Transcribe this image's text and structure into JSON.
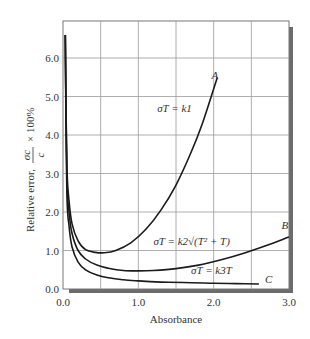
{
  "chart_data": {
    "type": "line",
    "title": "",
    "xlabel": "Absorbance",
    "ylabel": "Relative error, σc/c × 100%",
    "ylabel_parts": {
      "prefix": "Relative error,",
      "frac_num": "σc",
      "frac_den": "c",
      "suffix": "× 100%"
    },
    "xlim": [
      0.0,
      3.0
    ],
    "ylim": [
      0.0,
      6.0
    ],
    "x_ticks": [
      "0.0",
      "1.0",
      "2.0",
      "3.0"
    ],
    "y_ticks": [
      "0.0",
      "1.0",
      "2.0",
      "3.0",
      "4.0",
      "5.0",
      "6.0"
    ],
    "grid": true,
    "grid_step_x": 0.5,
    "grid_step_y": 1.0,
    "series": [
      {
        "name": "A",
        "equation": "σT = k1",
        "x": [
          0.03,
          0.05,
          0.08,
          0.12,
          0.2,
          0.3,
          0.43,
          0.55,
          0.7,
          0.9,
          1.1,
          1.3,
          1.5,
          1.7,
          1.85,
          2.0,
          2.05
        ],
        "y": [
          6.6,
          3.3,
          2.3,
          1.7,
          1.25,
          1.02,
          0.95,
          0.94,
          1.0,
          1.2,
          1.55,
          2.05,
          2.7,
          3.55,
          4.3,
          5.2,
          5.5
        ]
      },
      {
        "name": "B",
        "equation": "σT = k2√(T² + T)",
        "x": [
          0.03,
          0.05,
          0.08,
          0.12,
          0.2,
          0.3,
          0.45,
          0.6,
          0.8,
          1.0,
          1.2,
          1.5,
          1.8,
          2.1,
          2.4,
          2.7,
          3.0
        ],
        "y": [
          6.6,
          3.0,
          2.0,
          1.45,
          1.0,
          0.78,
          0.62,
          0.54,
          0.48,
          0.47,
          0.48,
          0.53,
          0.62,
          0.76,
          0.93,
          1.13,
          1.35
        ]
      },
      {
        "name": "C",
        "equation": "σT = k3T",
        "x": [
          0.03,
          0.05,
          0.08,
          0.12,
          0.2,
          0.3,
          0.45,
          0.6,
          0.8,
          1.0,
          1.3,
          1.6,
          2.0,
          2.3,
          2.6
        ],
        "y": [
          6.6,
          2.6,
          1.65,
          1.1,
          0.7,
          0.5,
          0.36,
          0.29,
          0.24,
          0.21,
          0.18,
          0.17,
          0.15,
          0.14,
          0.13
        ]
      }
    ],
    "annotations": [
      {
        "text": "A",
        "x": 1.97,
        "y": 5.45
      },
      {
        "text": "σT = k1",
        "x": 1.25,
        "y": 4.6
      },
      {
        "text": "B",
        "x": 2.9,
        "y": 1.55
      },
      {
        "text": "σT = k2√(T² + T)",
        "x": 1.2,
        "y": 1.15
      },
      {
        "text": "σT = k3T",
        "x": 1.7,
        "y": 0.4
      },
      {
        "text": "C",
        "x": 2.68,
        "y": 0.15
      }
    ]
  }
}
